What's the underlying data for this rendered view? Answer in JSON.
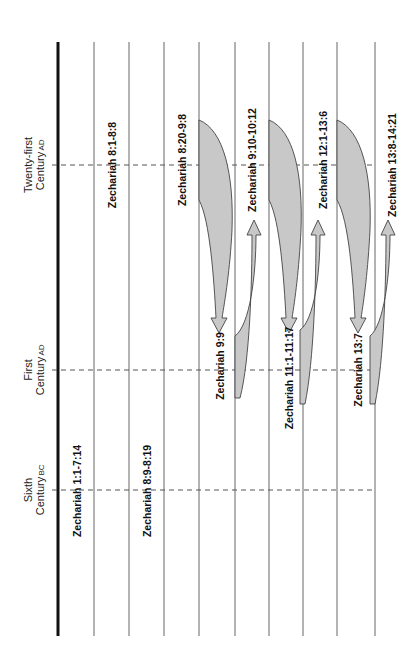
{
  "diagram": {
    "type": "timeline-prophecy-fulfillment",
    "orientation": "rotated-90",
    "eras": [
      {
        "name": "Twenty-first",
        "line2": "Century",
        "suffix": "AD",
        "y": 165
      },
      {
        "name": "First",
        "line2": "Century",
        "suffix": "AD",
        "y": 370
      },
      {
        "name": "Sixth",
        "line2": "Century",
        "suffix": "BC",
        "y": 490
      }
    ],
    "passages": [
      {
        "label": "Zechariah 1:1-7:14",
        "era": "Sixth Century BC"
      },
      {
        "label": "Zechariah 8:1-8:8",
        "era": "Twenty-first Century AD"
      },
      {
        "label": "Zechariah 8:9-8:19",
        "era": "Sixth Century BC"
      },
      {
        "label": "Zechariah 8:20-9:8",
        "era": "Twenty-first Century AD"
      },
      {
        "label": "Zechariah 9:9",
        "era": "First Century AD"
      },
      {
        "label": "Zechariah 9:10-10:12",
        "era": "Twenty-first Century AD"
      },
      {
        "label": "Zechariah 11:1-11:17",
        "era": "First Century AD"
      },
      {
        "label": "Zechariah 12:1-13:6",
        "era": "Twenty-first Century AD"
      },
      {
        "label": "Zechariah 13:7",
        "era": "First Century AD"
      },
      {
        "label": "Zechariah 13:8-14:21",
        "era": "Twenty-first Century AD"
      }
    ],
    "arrows": [
      {
        "from": "Zechariah 8:20-9:8",
        "to": "Zechariah 9:9"
      },
      {
        "from": "Zechariah 9:9",
        "to": "Zechariah 9:10-10:12"
      },
      {
        "from": "Zechariah 9:10-10:12",
        "to": "Zechariah 11:1-11:17"
      },
      {
        "from": "Zechariah 11:1-11:17",
        "to": "Zechariah 12:1-13:6"
      },
      {
        "from": "Zechariah 12:1-13:6",
        "to": "Zechariah 13:7"
      },
      {
        "from": "Zechariah 13:7",
        "to": "Zechariah 13:8-14:21"
      }
    ],
    "colors": {
      "fill": "#c8c8c8",
      "stroke": "#444444",
      "axis": "#111111"
    }
  }
}
